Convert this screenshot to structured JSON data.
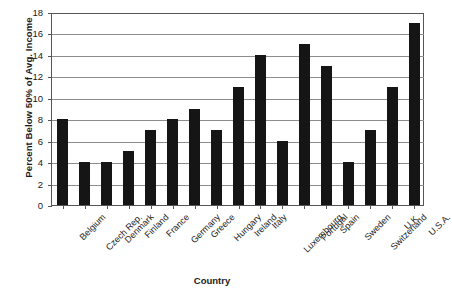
{
  "chart_data": {
    "type": "bar",
    "title": "",
    "xlabel": "Country",
    "ylabel": "Percent Below 50% of Avg. Income",
    "ylim": [
      0,
      18
    ],
    "ytick_step": 2,
    "yticks": [
      "18",
      "16",
      "14",
      "12",
      "10",
      "8",
      "6",
      "4",
      "2",
      "0"
    ],
    "grid": true,
    "legend": "none",
    "bar_color": "#151515",
    "gridline_color": "#8d8d8d",
    "axis_color": "#555555",
    "categories": [
      "Belgium",
      "Czech Rep.",
      "Denmark",
      "Finland",
      "France",
      "Germany",
      "Greece",
      "Hungary",
      "Ireland",
      "Italy",
      "Luxembourg",
      "Portugal",
      "Spain",
      "Sweden",
      "Switzerland",
      "U.K.",
      "U.S.A."
    ],
    "values": [
      8,
      4,
      4,
      5,
      7,
      8,
      9,
      7,
      11,
      14,
      6,
      15,
      13,
      4,
      7,
      11,
      17
    ]
  }
}
